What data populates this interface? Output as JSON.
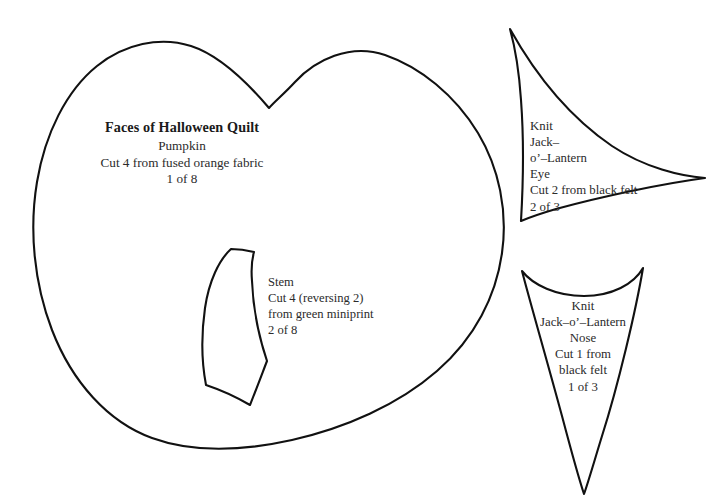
{
  "sheet": {
    "kind": "sewing-pattern-template-sheet",
    "background_color": "#ffffff",
    "outline_color": "#111111",
    "text_color": "#2b2b2b",
    "width": 709,
    "height": 501
  },
  "pieces": {
    "pumpkin": {
      "name": "pumpkin-body-piece",
      "label": {
        "title": "Faces of Halloween Quilt",
        "part": "Pumpkin",
        "instruction": "Cut 4 from fused orange fabric",
        "index": "1 of 8"
      }
    },
    "stem": {
      "name": "stem-piece",
      "label": {
        "part": "Stem",
        "instruction_line_1": "Cut 4 (reversing 2)",
        "instruction_line_2": "from green miniprint",
        "index": "2 of 8"
      }
    },
    "eye": {
      "name": "eye-piece",
      "label": {
        "title_line_1": "Knit",
        "title_line_2": "Jack–",
        "title_line_3": "o’–Lantern",
        "part": "Eye",
        "instruction": "Cut 2 from black felt",
        "index": "2 of 3"
      }
    },
    "nose": {
      "name": "nose-piece",
      "label": {
        "title_line_1": "Knit",
        "title_line_2": "Jack–o’–Lantern",
        "part": "Nose",
        "instruction_line_1": "Cut 1 from",
        "instruction_line_2": "black felt",
        "index": "1 of 3"
      }
    }
  }
}
